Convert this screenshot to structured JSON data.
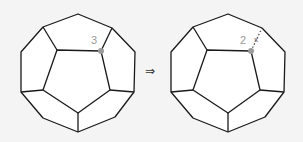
{
  "figure": {
    "left": {
      "vertex_label": "3",
      "marked_vertex_color": "#9a9a9a"
    },
    "arrow": "⇒",
    "right": {
      "vertex_label": "2",
      "removed_edge_mark": "x",
      "marked_vertex_color": "#9a9a9a"
    }
  }
}
